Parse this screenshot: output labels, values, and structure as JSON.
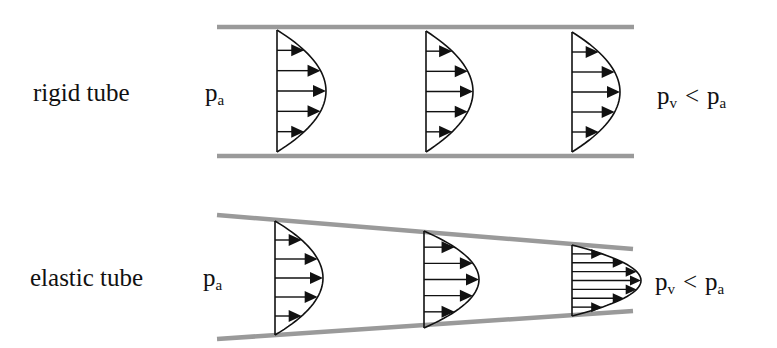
{
  "colors": {
    "wall": "#9a9a9a",
    "ink": "#111111",
    "background": "#ffffff"
  },
  "rows": [
    {
      "id": "rigid",
      "label": "rigid tube",
      "label_pos": {
        "x": 33,
        "y": 101
      },
      "inlet_pressure": {
        "main": "p",
        "sub": "a",
        "x": 205,
        "y": 101
      },
      "outlet_relation": {
        "p1": "p",
        "s1": "v",
        "op": "<",
        "p2": "p",
        "s2": "a",
        "x": 657,
        "y": 104
      },
      "walls": {
        "top": {
          "x1": 217,
          "y1": 27,
          "x2": 634,
          "y2": 27
        },
        "bottom": {
          "x1": 217,
          "y1": 156,
          "x2": 634,
          "y2": 156
        }
      },
      "profiles": [
        {
          "x": 277,
          "top": 30,
          "bottom": 152,
          "tip": 326,
          "arrows": 5
        },
        {
          "x": 426,
          "top": 31,
          "bottom": 152,
          "tip": 473,
          "arrows": 5
        },
        {
          "x": 572,
          "top": 32,
          "bottom": 152,
          "tip": 620,
          "arrows": 5
        }
      ]
    },
    {
      "id": "elastic",
      "label": "elastic tube",
      "label_pos": {
        "x": 30,
        "y": 286
      },
      "inlet_pressure": {
        "main": "p",
        "sub": "a",
        "x": 203,
        "y": 286
      },
      "outlet_relation": {
        "p1": "p",
        "s1": "v",
        "op": "<",
        "p2": "p",
        "s2": "a",
        "x": 655,
        "y": 290
      },
      "walls": {
        "top": {
          "x1": 217,
          "y1": 215,
          "x2": 633,
          "y2": 249
        },
        "bottom": {
          "x1": 217,
          "y1": 339,
          "x2": 633,
          "y2": 311
        }
      },
      "profiles": [
        {
          "x": 275,
          "top": 221,
          "bottom": 335,
          "tip": 323,
          "arrows": 5
        },
        {
          "x": 424,
          "top": 231,
          "bottom": 328,
          "tip": 479,
          "arrows": 5
        },
        {
          "x": 572,
          "top": 245,
          "bottom": 316,
          "tip": 641,
          "arrows": 7
        }
      ]
    }
  ]
}
